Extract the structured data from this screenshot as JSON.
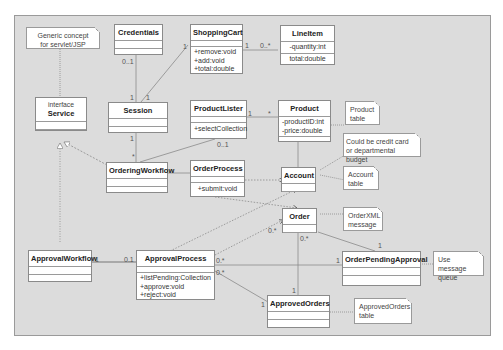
{
  "classes": {
    "credentials": {
      "name": "Credentials",
      "attrs": [],
      "ops": []
    },
    "shopping_cart": {
      "name": "ShoppingCart",
      "attrs": [],
      "ops": [
        "+remove:void",
        "+add:void",
        "+total:double"
      ]
    },
    "line_item": {
      "name": "LineItem",
      "attrs": [
        "-quantity:int"
      ],
      "ops": [
        "total:double"
      ]
    },
    "service": {
      "stereotype": "interface",
      "name": "Service"
    },
    "session": {
      "name": "Session"
    },
    "product_lister": {
      "name": "ProductLister",
      "ops": [
        "+selectCollection"
      ]
    },
    "product": {
      "name": "Product",
      "attrs": [
        "-productID:int",
        "-price:double"
      ]
    },
    "ordering_workflow": {
      "name": "OrderingWorkflow"
    },
    "order_process": {
      "name": "OrderProcess",
      "ops": [
        "+submit:void"
      ]
    },
    "account": {
      "name": "Account"
    },
    "order": {
      "name": "Order"
    },
    "approval_workflow": {
      "name": "ApprovalWorkflow"
    },
    "approval_process": {
      "name": "ApprovalProcess",
      "ops": [
        "+listPending:Collection",
        "+approve:void",
        "+reject:void"
      ]
    },
    "order_pending_approval": {
      "name": "OrderPendingApproval"
    },
    "approved_orders": {
      "name": "ApprovedOrders"
    }
  },
  "notes": {
    "generic": [
      "Generic concept",
      "for servlet/JSP"
    ],
    "product_table": [
      "Product",
      "table"
    ],
    "credit_card": [
      "Could be credit card",
      "or departmental budget"
    ],
    "account_table": [
      "Account",
      "table"
    ],
    "order_xml": [
      "OrderXML",
      "message"
    ],
    "message_queue": [
      "Use message",
      "queue"
    ],
    "approved_orders_table": [
      "ApprovedOrders",
      "table"
    ]
  },
  "multiplicities": {
    "credentials_session": "0..1",
    "session_credentials": "1",
    "session_cart": "1",
    "cart_session": "1",
    "cart_lineitem": "1",
    "lineitem_cart": "0..*",
    "lister_product": "1",
    "product_lister": "*",
    "session_workflow": "1",
    "workflow_session": "*",
    "lister_workflow": "0..1",
    "approvalwf_process": "1",
    "process_approvalwf": "0.1",
    "process_order": "0.*",
    "process_pending": "0.*",
    "pending_process": "1",
    "process_approved": "0.*",
    "approved_process": "1",
    "order_pending": "0.*",
    "pending_order": "1",
    "order_approved": "1"
  }
}
